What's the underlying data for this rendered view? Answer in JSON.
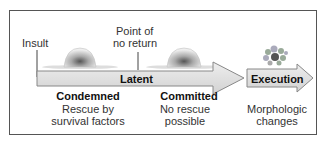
{
  "diagram": {
    "markers": {
      "insult": "Insult",
      "point_of_no_return_line1": "Point of",
      "point_of_no_return_line2": "no return"
    },
    "arrows": {
      "latent_label": "Latent",
      "execution_label": "Execution"
    },
    "phases": [
      {
        "title": "Condemned",
        "desc_line1": "Rescue by",
        "desc_line2": "survival factors"
      },
      {
        "title": "Committed",
        "desc_line1": "No rescue",
        "desc_line2": "possible"
      },
      {
        "title": "",
        "desc_line1": "Morphologic",
        "desc_line2": "changes"
      }
    ],
    "icons": [
      "normal-cell-icon",
      "normal-cell-icon",
      "fragmented-cell-icon"
    ],
    "colors": {
      "arrow_fill": "#d9d9d9",
      "arrow_stroke": "#888888",
      "frame": "#555555"
    }
  }
}
